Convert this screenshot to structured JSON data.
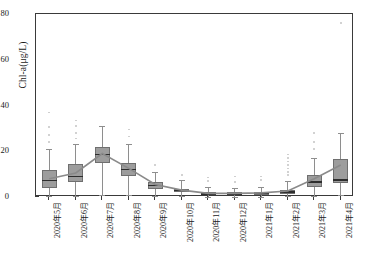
{
  "chart_data": {
    "type": "bar",
    "subtype": "boxplot-with-mean-trend",
    "title": "",
    "xlabel": "",
    "ylabel": "Chl-a(μg/L)",
    "ylim": [
      0,
      80
    ],
    "yticks": [
      0,
      20,
      40,
      60,
      80
    ],
    "grid": false,
    "legend": null,
    "categories": [
      "2020年5月",
      "2020年6月",
      "2020年7月",
      "2020年8月",
      "2020年9月",
      "2020年10月",
      "2020年11月",
      "2020年12月",
      "2021年1月",
      "2021年2月",
      "2021年3月",
      "2021年4月"
    ],
    "boxes": [
      {
        "category": "2020年5月",
        "whisker_low": 0.4,
        "q1": 4.0,
        "median": 7.2,
        "q3": 12.0,
        "whisker_high": 21.0,
        "mean": 8.0,
        "outliers": [
          24.0,
          27.0,
          30.5,
          37.0
        ]
      },
      {
        "category": "2020年6月",
        "whisker_low": 0.6,
        "q1": 6.5,
        "median": 9.0,
        "q3": 14.5,
        "whisker_high": 23.0,
        "mean": 10.5,
        "outliers": [
          25.5,
          28.0,
          31.0,
          33.5
        ]
      },
      {
        "category": "2020年7月",
        "whisker_low": 1.0,
        "q1": 15.0,
        "median": 18.5,
        "q3": 22.0,
        "whisker_high": 31.0,
        "mean": 19.0,
        "outliers": []
      },
      {
        "category": "2020年8月",
        "whisker_low": 0.8,
        "q1": 9.0,
        "median": 12.0,
        "q3": 15.0,
        "whisker_high": 23.0,
        "mean": 12.5,
        "outliers": [
          26.5,
          29.5
        ]
      },
      {
        "category": "2020年9月",
        "whisker_low": 0.5,
        "q1": 3.5,
        "median": 5.0,
        "q3": 6.5,
        "whisker_high": 11.0,
        "mean": 5.5,
        "outliers": [
          14.0
        ]
      },
      {
        "category": "2020年10月",
        "whisker_low": 0.3,
        "q1": 2.0,
        "median": 2.8,
        "q3": 3.6,
        "whisker_high": 7.5,
        "mean": 3.0,
        "outliers": [
          9.5
        ]
      },
      {
        "category": "2020年11月",
        "whisker_low": 0.2,
        "q1": 1.0,
        "median": 1.4,
        "q3": 2.0,
        "whisker_high": 4.5,
        "mean": 1.6,
        "outliers": [
          7.0,
          8.5
        ]
      },
      {
        "category": "2020年12月",
        "whisker_low": 0.2,
        "q1": 1.0,
        "median": 1.4,
        "q3": 2.0,
        "whisker_high": 4.0,
        "mean": 1.6,
        "outliers": [
          6.5,
          9.0
        ]
      },
      {
        "category": "2021年1月",
        "whisker_low": 0.2,
        "q1": 1.0,
        "median": 1.5,
        "q3": 2.2,
        "whisker_high": 4.5,
        "mean": 1.8,
        "outliers": [
          7.5,
          9.0
        ]
      },
      {
        "category": "2021年2月",
        "whisker_low": 0.3,
        "q1": 1.4,
        "median": 2.2,
        "q3": 3.2,
        "whisker_high": 7.0,
        "mean": 2.6,
        "outliers": [
          9.5,
          11.0,
          12.5,
          14.0,
          15.5,
          17.0,
          18.5
        ]
      },
      {
        "category": "2021年3月",
        "whisker_low": 0.5,
        "q1": 4.5,
        "median": 6.5,
        "q3": 9.5,
        "whisker_high": 17.0,
        "mean": 8.0,
        "outliers": [
          21.0,
          24.0,
          28.0
        ]
      },
      {
        "category": "2021年4月",
        "whisker_low": 0.8,
        "q1": 6.0,
        "median": 7.5,
        "q3": 16.5,
        "whisker_high": 28.0,
        "mean": 14.0,
        "outliers": [
          76.0
        ]
      }
    ],
    "mean_series": {
      "name": "mean",
      "values": [
        8.0,
        10.5,
        19.0,
        12.5,
        5.5,
        3.0,
        1.6,
        1.6,
        1.8,
        2.6,
        8.0,
        14.0
      ]
    }
  },
  "style": {
    "box_fill": "#9d9d9d",
    "box_edge": "#6f6f6f",
    "median_color": "#2e2e2e",
    "whisker_color": "#8e8e8e",
    "outlier_color": "#c9c9c9",
    "mean_line_color": "#8a8a8a",
    "axis_color": "#3a3a3a",
    "background": "#ffffff"
  }
}
